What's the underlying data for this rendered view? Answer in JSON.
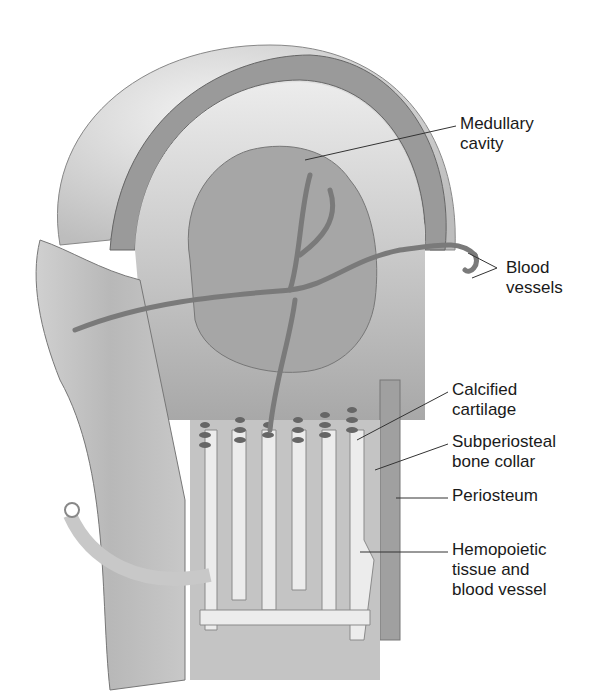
{
  "figure": {
    "labels": [
      {
        "id": "medullary-cavity",
        "text": "Medullary\ncavity",
        "x": 460,
        "y": 114,
        "leader": [
          [
            305,
            160
          ],
          [
            456,
            126
          ]
        ]
      },
      {
        "id": "blood-vessels",
        "text": "Blood\nvessels",
        "x": 506,
        "y": 258,
        "leader": [
          [
            468,
            253
          ],
          [
            497,
            268
          ],
          [
            472,
            278
          ]
        ]
      },
      {
        "id": "calcified-cartilage",
        "text": "Calcified\ncartilage",
        "x": 452,
        "y": 380,
        "leader": [
          [
            357,
            440
          ],
          [
            448,
            392
          ]
        ]
      },
      {
        "id": "subperiosteal-bone-collar",
        "text": "Subperiosteal\nbone collar",
        "x": 452,
        "y": 432,
        "leader": [
          [
            375,
            470
          ],
          [
            448,
            444
          ]
        ]
      },
      {
        "id": "periosteum",
        "text": "Periosteum",
        "x": 452,
        "y": 486,
        "leader": [
          [
            396,
            498
          ],
          [
            448,
            498
          ]
        ]
      },
      {
        "id": "hemopoietic-tissue",
        "text": "Hemopoietic\ntissue and\nblood vessel",
        "x": 452,
        "y": 540,
        "leader": [
          [
            360,
            552
          ],
          [
            448,
            552
          ]
        ]
      }
    ]
  }
}
